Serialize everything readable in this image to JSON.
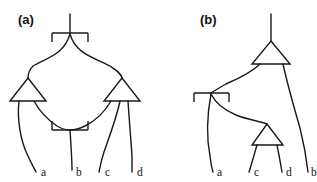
{
  "figure": {
    "background_color": "#ffffff",
    "ink_color": "#1a1a1a",
    "panels": [
      {
        "id": "a",
        "label": "(a)",
        "label_x": 18,
        "label_y": 24,
        "output_labels": [
          {
            "name": "a",
            "x": 41,
            "y": 176
          },
          {
            "name": "b",
            "x": 76,
            "y": 176
          },
          {
            "name": "c",
            "x": 105,
            "y": 176
          },
          {
            "name": "d",
            "x": 134,
            "y": 176
          }
        ]
      },
      {
        "id": "b",
        "label": "(b)",
        "label_x": 200,
        "label_y": 24,
        "output_labels": [
          {
            "name": "a",
            "x": 217,
            "y": 176
          },
          {
            "name": "c",
            "x": 254,
            "y": 176
          },
          {
            "name": "d",
            "x": 280,
            "y": 176
          },
          {
            "name": "b",
            "x": 305,
            "y": 176
          }
        ]
      }
    ]
  },
  "diagram_a": {
    "top_cap": {
      "stem_top_x": 70,
      "stem_top_y": 14,
      "stem_bottom_x": 70,
      "stem_bottom_y": 33,
      "bar_left_x": 52,
      "bar_right_x": 88,
      "bar_y": 33,
      "tick_left_bottom_y": 42,
      "tick_right_bottom_y": 42
    },
    "bottom_cup": {
      "bar_left_x": 52,
      "bar_right_x": 88,
      "bar_y": 130,
      "tick_left_top_y": 121,
      "tick_right_top_y": 121,
      "stem_top_x": 70,
      "stem_top_y": 130,
      "stem_bottom_x": 72,
      "stem_bottom_y": 170
    },
    "triangle_left": {
      "apex_x": 28,
      "apex_y": 78,
      "base_left_x": 10,
      "base_right_x": 46,
      "base_y": 101
    },
    "triangle_right": {
      "apex_x": 122,
      "apex_y": 78,
      "base_left_x": 104,
      "base_right_x": 140,
      "base_y": 101
    },
    "wires": [
      {
        "name": "cap-left-arm",
        "path": "M70,34 C64,55 46,58 33,66 C30,69 28,73 28,78"
      },
      {
        "name": "cap-right-arm",
        "path": "M70,34 C76,55 96,58 110,66 C116,70 121,73 122,78"
      },
      {
        "name": "tri-left-out-a",
        "path": "M19,101 C17,118 20,140 28,156 C31,163 34,168 36,172"
      },
      {
        "name": "tri-left-out-to-cup",
        "path": "M34,101 C40,112 48,120 57,126 C62,129 66,130 70,130"
      },
      {
        "name": "tri-right-out-to-cup",
        "path": "M111,101 C104,113 95,121 85,126 C79,129 74,130 70,130"
      },
      {
        "name": "tri-right-out-c",
        "path": "M120,101 C117,116 110,135 104,152 C101,161 100,167 99,172"
      },
      {
        "name": "tri-right-out-d",
        "path": "M128,101 C129,118 131,140 132,156 C132,164 132,169 132,172"
      }
    ]
  },
  "diagram_b": {
    "top_stem": {
      "x": 271,
      "top_y": 14,
      "bottom_y": 41
    },
    "triangle_top": {
      "apex_x": 271,
      "apex_y": 41,
      "base_left_x": 252,
      "base_right_x": 290,
      "base_y": 64
    },
    "triangle_bottom": {
      "apex_x": 267,
      "apex_y": 124,
      "base_left_x": 252,
      "base_right_x": 283,
      "base_y": 145
    },
    "cap": {
      "bar_left_x": 194,
      "bar_right_x": 229,
      "bar_y": 93,
      "tick_left_bottom_y": 102,
      "tick_right_bottom_y": 102,
      "center_x": 211,
      "center_y": 93
    },
    "wires": [
      {
        "name": "tri-top-out-left",
        "path": "M260,64 C252,72 240,78 226,84 C219,88 214,91 211,93"
      },
      {
        "name": "cap-left-arm-a",
        "path": "M211,94 C208,110 206,135 210,156 C211,164 212,169 213,172"
      },
      {
        "name": "cap-right-arm-to-tri",
        "path": "M211,94 C216,104 224,110 236,115 C249,120 259,121 267,124"
      },
      {
        "name": "tri-top-out-right",
        "path": "M283,64 C287,82 293,104 300,128 C305,148 307,163 308,172"
      },
      {
        "name": "tri-bottom-out-c",
        "path": "M257,145 C254,155 251,166 249,172"
      },
      {
        "name": "tri-bottom-out-d",
        "path": "M277,145 C279,155 281,166 282,172"
      }
    ]
  }
}
